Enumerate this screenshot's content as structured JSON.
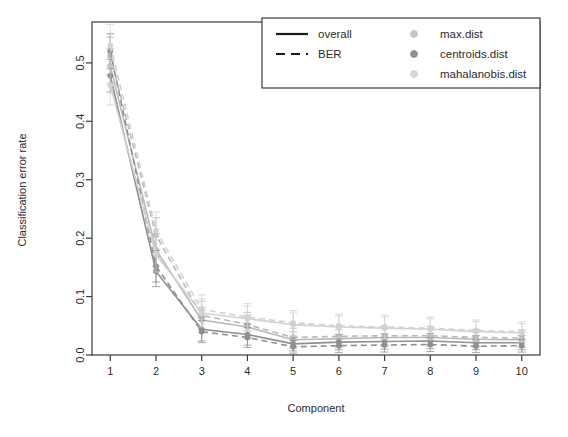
{
  "chart_data": {
    "type": "line",
    "title": "",
    "xlabel": "Component",
    "ylabel": "Classification error rate",
    "x": [
      1,
      2,
      3,
      4,
      5,
      6,
      7,
      8,
      9,
      10
    ],
    "xlim": [
      0.6,
      10.4
    ],
    "ylim": [
      0.0,
      0.57
    ],
    "xticks": [
      "1",
      "2",
      "3",
      "4",
      "5",
      "6",
      "7",
      "8",
      "9",
      "10"
    ],
    "yticks": [
      "0.0",
      "0.1",
      "0.2",
      "0.3",
      "0.4",
      "0.5"
    ],
    "ytick_values": [
      0.0,
      0.1,
      0.2,
      0.3,
      0.4,
      0.5
    ],
    "grid": false,
    "legend_position": "top-right",
    "error_bars": true,
    "series": [
      {
        "name": "max.dist overall",
        "dist": "max.dist",
        "measure": "overall",
        "style": "solid",
        "color": "#b9b9b9",
        "values": [
          0.495,
          0.18,
          0.06,
          0.048,
          0.026,
          0.028,
          0.03,
          0.03,
          0.027,
          0.026
        ],
        "err": [
          0.03,
          0.028,
          0.022,
          0.02,
          0.014,
          0.015,
          0.015,
          0.015,
          0.013,
          0.013
        ]
      },
      {
        "name": "max.dist BER",
        "dist": "max.dist",
        "measure": "BER",
        "style": "dashed",
        "color": "#b9b9b9",
        "values": [
          0.512,
          0.205,
          0.068,
          0.052,
          0.03,
          0.032,
          0.033,
          0.033,
          0.03,
          0.029
        ],
        "err": [
          0.032,
          0.03,
          0.024,
          0.021,
          0.016,
          0.016,
          0.016,
          0.016,
          0.014,
          0.014
        ]
      },
      {
        "name": "centroids.dist overall",
        "dist": "centroids.dist",
        "measure": "overall",
        "style": "solid",
        "color": "#8f8f8f",
        "values": [
          0.478,
          0.143,
          0.044,
          0.035,
          0.019,
          0.022,
          0.023,
          0.024,
          0.021,
          0.021
        ],
        "err": [
          0.028,
          0.026,
          0.02,
          0.018,
          0.012,
          0.013,
          0.013,
          0.013,
          0.012,
          0.012
        ]
      },
      {
        "name": "centroids.dist BER",
        "dist": "centroids.dist",
        "measure": "BER",
        "style": "dashed",
        "color": "#8f8f8f",
        "values": [
          0.52,
          0.152,
          0.04,
          0.03,
          0.014,
          0.016,
          0.017,
          0.018,
          0.015,
          0.016
        ],
        "err": [
          0.03,
          0.027,
          0.019,
          0.017,
          0.011,
          0.012,
          0.012,
          0.012,
          0.011,
          0.011
        ]
      },
      {
        "name": "mahalanobis.dist overall",
        "dist": "mahalanobis.dist",
        "measure": "overall",
        "style": "solid",
        "color": "#d2d2d2",
        "values": [
          0.462,
          0.172,
          0.072,
          0.062,
          0.052,
          0.048,
          0.046,
          0.044,
          0.04,
          0.038
        ],
        "err": [
          0.034,
          0.03,
          0.024,
          0.022,
          0.02,
          0.019,
          0.019,
          0.018,
          0.017,
          0.016
        ]
      },
      {
        "name": "mahalanobis.dist BER",
        "dist": "mahalanobis.dist",
        "measure": "BER",
        "style": "dashed",
        "color": "#d2d2d2",
        "values": [
          0.53,
          0.213,
          0.078,
          0.065,
          0.055,
          0.05,
          0.048,
          0.046,
          0.042,
          0.04
        ],
        "err": [
          0.036,
          0.032,
          0.025,
          0.023,
          0.021,
          0.02,
          0.02,
          0.019,
          0.018,
          0.017
        ]
      }
    ]
  },
  "legend": {
    "lines": [
      {
        "label": "overall",
        "style": "solid",
        "color": "#1a1a1a"
      },
      {
        "label": "BER",
        "style": "dashed",
        "color": "#1a1a1a"
      }
    ],
    "points": [
      {
        "label": "max.dist",
        "color": "#c4c4c4"
      },
      {
        "label": "centroids.dist",
        "color": "#8f8f8f"
      },
      {
        "label": "mahalanobis.dist",
        "color": "#d6d6d6"
      }
    ]
  },
  "axes": {
    "xlabel": "Component",
    "ylabel": "Classification error rate"
  }
}
